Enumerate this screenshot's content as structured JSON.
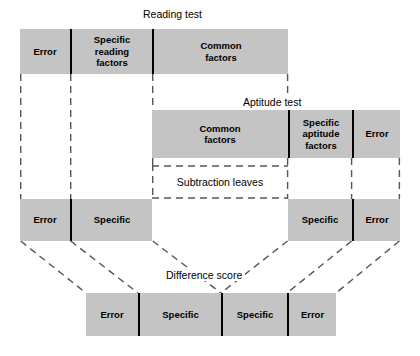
{
  "diagram": {
    "title_note": "Decomposition of reading test and aptitude test variance into common, specific and error components",
    "colors": {
      "bar_fill": "#c4c4c4",
      "divider": "#000000",
      "dashed_line": "#555555",
      "text": "#000000",
      "background": "#ffffff"
    },
    "rows": [
      {
        "id": "reading-test",
        "label": "Reading test",
        "label_x": 140,
        "label_y": 8,
        "x": 20,
        "y": 29,
        "width": 268,
        "height": 45,
        "segments": [
          {
            "label": "Error",
            "width": 50
          },
          {
            "label": "Specific\nreading\nfactors",
            "width": 82
          },
          {
            "label": "Common\nfactors",
            "width": 136
          }
        ]
      },
      {
        "id": "aptitude-test",
        "label": "Aptitude test",
        "label_x": 240,
        "label_y": 96,
        "x": 152,
        "y": 110,
        "width": 248,
        "height": 48,
        "segments": [
          {
            "label": "Common\nfactors",
            "width": 136
          },
          {
            "label": "Specific\naptitude\nfactors",
            "width": 64
          },
          {
            "label": "Error",
            "width": 48
          }
        ]
      },
      {
        "id": "residual-left",
        "label": "",
        "x": 20,
        "y": 199,
        "width": 132,
        "height": 42,
        "segments": [
          {
            "label": "Error",
            "width": 50
          },
          {
            "label": "Specific",
            "width": 82
          }
        ]
      },
      {
        "id": "residual-right",
        "label": "",
        "x": 288,
        "y": 199,
        "width": 112,
        "height": 42,
        "segments": [
          {
            "label": "Specific",
            "width": 64
          },
          {
            "label": "Error",
            "width": 48
          }
        ]
      },
      {
        "id": "difference-score",
        "label": "Difference score",
        "label_x": 163,
        "label_y": 269,
        "x": 86,
        "y": 293,
        "width": 250,
        "height": 43,
        "segments": [
          {
            "label": "Error",
            "width": 52
          },
          {
            "label": "Specific",
            "width": 83
          },
          {
            "label": "Specific",
            "width": 66
          },
          {
            "label": "Error",
            "width": 49
          }
        ]
      }
    ],
    "subtraction": {
      "label": "Subtraction leaves",
      "x": 152,
      "y": 166,
      "width": 136,
      "height": 32
    }
  }
}
